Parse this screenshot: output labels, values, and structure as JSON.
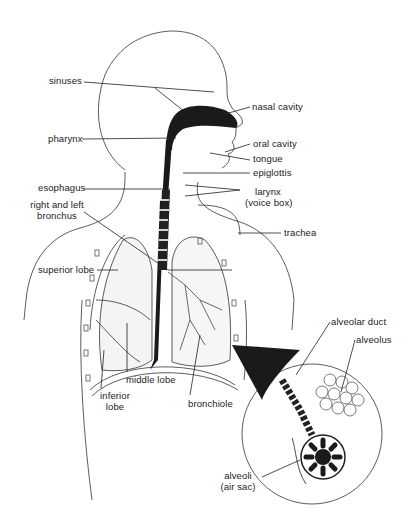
{
  "diagram": {
    "labels": {
      "sinuses": "sinuses",
      "nasal_cavity": "nasal cavity",
      "pharynx": "pharynx",
      "oral_cavity": "oral cavity",
      "tongue": "tongue",
      "epiglottis": "epiglottis",
      "esophagus": "esophagus",
      "larynx_line1": "larynx",
      "larynx_line2": "(voice box)",
      "bronchus_line1": "right and left",
      "bronchus_line2": "bronchus",
      "trachea": "trachea",
      "superior_lobe": "superior lobe",
      "middle_lobe": "middle lobe",
      "inferior_lobe_line1": "inferior",
      "inferior_lobe_line2": "lobe",
      "bronchiole": "bronchiole",
      "alveolar_duct": "alveolar duct",
      "alveolus": "alveolus",
      "alveoli_line1": "alveoli",
      "alveoli_line2": "(air sac)"
    },
    "colors": {
      "line": "#222222",
      "fill_dark": "#1a1a1a",
      "background": "#ffffff"
    }
  }
}
